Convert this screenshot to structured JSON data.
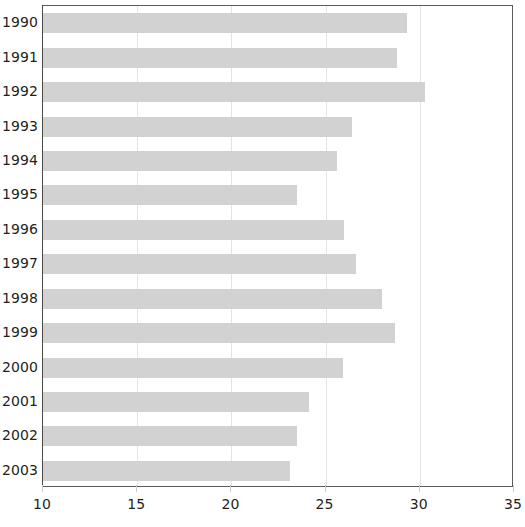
{
  "chart_data": {
    "type": "bar",
    "orientation": "horizontal",
    "title": "",
    "subtitle": "",
    "xlabel": "",
    "ylabel": "",
    "categories": [
      "1990",
      "1991",
      "1992",
      "1993",
      "1994",
      "1995",
      "1996",
      "1997",
      "1998",
      "1999",
      "2000",
      "2001",
      "2002",
      "2003"
    ],
    "values": [
      29.3,
      28.8,
      30.3,
      26.4,
      25.6,
      23.5,
      26.0,
      26.6,
      28.0,
      28.7,
      25.9,
      24.1,
      23.5,
      23.1
    ],
    "series": [
      {
        "name": "",
        "values": [
          29.3,
          28.8,
          30.3,
          26.4,
          25.6,
          23.5,
          26.0,
          26.6,
          28.0,
          28.7,
          25.9,
          24.1,
          23.5,
          23.1
        ]
      }
    ],
    "xlim": [
      10,
      35
    ],
    "xticks": [
      10,
      15,
      20,
      25,
      30,
      35
    ],
    "xtick_labels": [
      "10",
      "15",
      "20",
      "25",
      "30",
      "35"
    ],
    "grid": "vertical-only",
    "legend": "none",
    "bar_color": "#d2d2d2",
    "gridline_color": "#e3e3e3",
    "frame_color": "#5b5b5b",
    "text_color": "#231f20",
    "background": "#ffffff",
    "annotations": []
  }
}
